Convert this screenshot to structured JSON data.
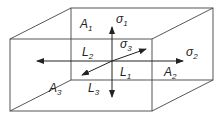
{
  "diagram": {
    "labels": {
      "A1": {
        "base": "A",
        "sub": "1"
      },
      "A2": {
        "base": "A",
        "sub": "2"
      },
      "A3": {
        "base": "A",
        "sub": "3"
      },
      "L1": {
        "base": "L",
        "sub": "1"
      },
      "L2": {
        "base": "L",
        "sub": "2"
      },
      "L3": {
        "base": "L",
        "sub": "3"
      },
      "sigma1": {
        "base": "σ",
        "sub": "1"
      },
      "sigma2": {
        "base": "σ",
        "sub": "2"
      },
      "sigma3": {
        "base": "σ",
        "sub": "3"
      }
    },
    "colors": {
      "line": "#333333",
      "arrow": "#222222",
      "background": "#ffffff"
    }
  }
}
